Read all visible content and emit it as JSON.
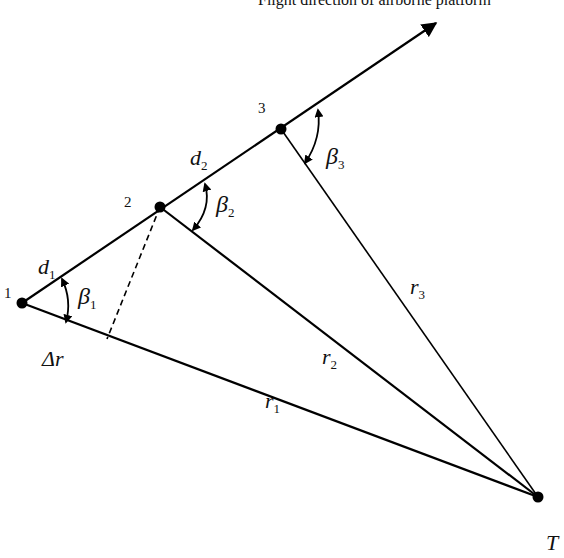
{
  "caption": "Flight direction of airborne platform",
  "points": {
    "p1": {
      "label": "1"
    },
    "p2": {
      "label": "2"
    },
    "p3": {
      "label": "3"
    },
    "target": {
      "label": "T"
    }
  },
  "segments": {
    "d1": {
      "main": "d",
      "sub": "1"
    },
    "d2": {
      "main": "d",
      "sub": "2"
    },
    "r1": {
      "main": "r",
      "sub": "1"
    },
    "r2": {
      "main": "r",
      "sub": "2"
    },
    "r3": {
      "main": "r",
      "sub": "3"
    },
    "delta_r": "Δr"
  },
  "angles": {
    "beta1": {
      "main": "β",
      "sub": "1"
    },
    "beta2": {
      "main": "β",
      "sub": "2"
    },
    "beta3": {
      "main": "β",
      "sub": "3"
    }
  }
}
